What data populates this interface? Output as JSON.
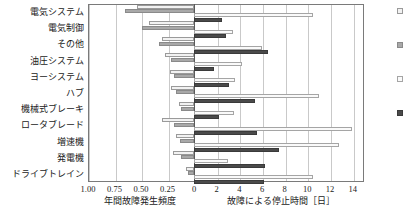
{
  "chart_data": {
    "type": "bar",
    "subtype": "back-to-back-horizontal",
    "title": "",
    "categories": [
      "電気システム",
      "電気制御",
      "その他",
      "油圧システム",
      "ヨーシステム",
      "ハブ",
      "機械式ブレーキ",
      "ロータブレード",
      "増速機",
      "発電機",
      "ドライブトレイン"
    ],
    "left_axis": {
      "label": "年間故障発生頻度",
      "ticks": [
        "1.00",
        "0.75",
        "0.50",
        "0.25",
        "0"
      ],
      "tick_values": [
        1.0,
        0.75,
        0.5,
        0.25,
        0
      ],
      "range": [
        1.0,
        0
      ],
      "direction": "right-to-left",
      "grid": true
    },
    "right_axis": {
      "label": "故障による停止時間［日］",
      "ticks": [
        "0",
        "2",
        "4",
        "6",
        "8",
        "10",
        "12",
        "14"
      ],
      "tick_values": [
        0,
        2,
        4,
        6,
        8,
        10,
        12,
        14
      ],
      "range": [
        0,
        15
      ],
      "direction": "left-to-right",
      "grid": true
    },
    "series": [
      {
        "name": "failure-frequency-open",
        "side": "left",
        "style": "open",
        "axis": "left_axis",
        "values": [
          0.54,
          0.42,
          0.3,
          0.27,
          0.23,
          0.22,
          0.14,
          0.3,
          0.17,
          0.2,
          0.08
        ]
      },
      {
        "name": "failure-frequency-mid",
        "side": "left",
        "style": "mid",
        "axis": "left_axis",
        "values": [
          0.65,
          0.49,
          0.33,
          0.22,
          0.19,
          0.17,
          0.12,
          0.19,
          0.13,
          0.12,
          0.06
        ]
      },
      {
        "name": "downtime-open",
        "side": "right",
        "style": "open2",
        "axis": "right_axis",
        "values": [
          10.5,
          3.4,
          6.0,
          4.2,
          3.6,
          11.0,
          3.5,
          13.9,
          12.8,
          3.0,
          10.5
        ]
      },
      {
        "name": "downtime-dark",
        "side": "right",
        "style": "dark",
        "axis": "right_axis",
        "values": [
          2.5,
          2.8,
          6.5,
          1.8,
          3.1,
          5.4,
          2.2,
          5.6,
          7.5,
          6.3,
          6.2
        ]
      }
    ],
    "legend": {
      "position": "right",
      "entries": [
        {
          "style": "open",
          "label": ""
        },
        {
          "style": "mid",
          "label": ""
        },
        {
          "style": "open2",
          "label": ""
        },
        {
          "style": "dark",
          "label": ""
        }
      ]
    }
  }
}
